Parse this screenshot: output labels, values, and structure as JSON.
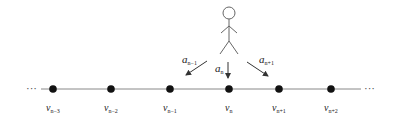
{
  "diagram": {
    "type": "walker-on-line",
    "colors": {
      "line": "#888888",
      "node": "#111111",
      "figure": "#666666",
      "text": "#222222",
      "background": "#ffffff"
    },
    "ellipsis_left": "···",
    "ellipsis_right": "···",
    "nodes": [
      {
        "id": "v_n-3",
        "base": "v",
        "sub": "n−3",
        "x": 53
      },
      {
        "id": "v_n-2",
        "base": "v",
        "sub": "n−2",
        "x": 111
      },
      {
        "id": "v_n-1",
        "base": "v",
        "sub": "n−1",
        "x": 170
      },
      {
        "id": "v_n",
        "base": "v",
        "sub": "n",
        "x": 229
      },
      {
        "id": "v_n+1",
        "base": "v",
        "sub": "n+1",
        "x": 279
      },
      {
        "id": "v_n+2",
        "base": "v",
        "sub": "n+2",
        "x": 331
      }
    ],
    "arrows": [
      {
        "id": "a_n-1",
        "base": "a",
        "sub": "n−1",
        "target": "v_n-1"
      },
      {
        "id": "a_n",
        "base": "a",
        "sub": "n",
        "target": "v_n"
      },
      {
        "id": "a_n+1",
        "base": "a",
        "sub": "n+1",
        "target": "v_n+1"
      }
    ],
    "figure": "stick-person"
  }
}
